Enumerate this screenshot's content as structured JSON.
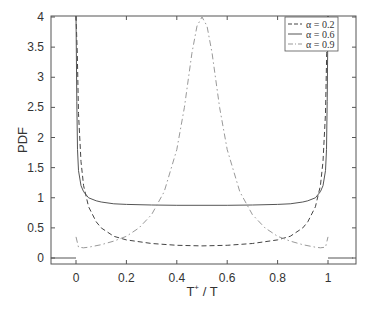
{
  "chart_data": {
    "type": "line",
    "title": "",
    "xlabel": "T⁺ / T",
    "ylabel": "PDF",
    "xlim": [
      -0.1,
      1.1
    ],
    "ylim": [
      -0.1,
      4.1
    ],
    "xticks": [
      0,
      0.2,
      0.4,
      0.6,
      0.8,
      1
    ],
    "xtick_labels": [
      "0",
      "0.2",
      "0.4",
      "0.6",
      "0.8",
      "1"
    ],
    "yticks": [
      0,
      0.5,
      1,
      1.5,
      2,
      2.5,
      3,
      3.5,
      4
    ],
    "ytick_labels": [
      "0",
      "0.5",
      "1",
      "1.5",
      "2",
      "2.5",
      "3",
      "3.5",
      "4"
    ],
    "grid": false,
    "legend_position": "upper right",
    "series": [
      {
        "name": "α = 0.2",
        "style": "dashed",
        "color": "#444444",
        "x": [
          0.0,
          0.005,
          0.01,
          0.02,
          0.03,
          0.05,
          0.08,
          0.1,
          0.15,
          0.2,
          0.3,
          0.4,
          0.5,
          0.6,
          0.7,
          0.8,
          0.85,
          0.9,
          0.92,
          0.95,
          0.97,
          0.98,
          0.99,
          0.995,
          1.0
        ],
        "y": [
          4.1,
          3.4,
          2.4,
          1.6,
          1.2,
          0.85,
          0.6,
          0.5,
          0.36,
          0.3,
          0.24,
          0.21,
          0.2,
          0.21,
          0.24,
          0.3,
          0.36,
          0.5,
          0.6,
          0.85,
          1.2,
          1.6,
          2.4,
          3.4,
          4.1
        ]
      },
      {
        "name": "α = 0.6",
        "style": "solid",
        "color": "#555555",
        "x": [
          0.0,
          0.003,
          0.006,
          0.01,
          0.02,
          0.03,
          0.05,
          0.08,
          0.1,
          0.15,
          0.2,
          0.3,
          0.4,
          0.5,
          0.6,
          0.7,
          0.8,
          0.85,
          0.9,
          0.92,
          0.95,
          0.97,
          0.98,
          0.99,
          0.994,
          0.997,
          1.0
        ],
        "y": [
          4.1,
          2.6,
          1.8,
          1.45,
          1.2,
          1.1,
          1.0,
          0.95,
          0.93,
          0.9,
          0.89,
          0.88,
          0.875,
          0.875,
          0.875,
          0.88,
          0.89,
          0.9,
          0.93,
          0.95,
          1.0,
          1.1,
          1.2,
          1.45,
          1.8,
          2.6,
          4.1
        ]
      },
      {
        "name": "α = 0.9",
        "style": "dash-dot",
        "color": "#999999",
        "x": [
          0.0,
          0.01,
          0.03,
          0.05,
          0.1,
          0.15,
          0.2,
          0.25,
          0.3,
          0.35,
          0.4,
          0.43,
          0.46,
          0.48,
          0.5,
          0.52,
          0.54,
          0.57,
          0.6,
          0.65,
          0.7,
          0.75,
          0.8,
          0.85,
          0.9,
          0.95,
          0.97,
          0.99,
          1.0
        ],
        "y": [
          0.35,
          0.18,
          0.17,
          0.18,
          0.22,
          0.28,
          0.36,
          0.5,
          0.72,
          1.1,
          1.8,
          2.5,
          3.4,
          3.85,
          4.0,
          3.85,
          3.4,
          2.5,
          1.8,
          1.1,
          0.72,
          0.5,
          0.36,
          0.28,
          0.22,
          0.18,
          0.17,
          0.18,
          0.35
        ]
      },
      {
        "name": "outside-support",
        "style": "solid",
        "color": "#555555",
        "segments": [
          {
            "x": [
              -0.1,
              0.0
            ],
            "y": [
              0,
              0
            ]
          },
          {
            "x": [
              1.0,
              1.1
            ],
            "y": [
              0,
              0
            ]
          }
        ]
      }
    ]
  },
  "legend": {
    "items": [
      {
        "label": "α = 0.2",
        "style": "dashed"
      },
      {
        "label": "α = 0.6",
        "style": "solid"
      },
      {
        "label": "α = 0.9",
        "style": "dash-dot"
      }
    ]
  },
  "axes": {
    "xlabel_main": "T",
    "xlabel_sup": "+",
    "xlabel_tail": " / T",
    "ylabel": "PDF"
  }
}
